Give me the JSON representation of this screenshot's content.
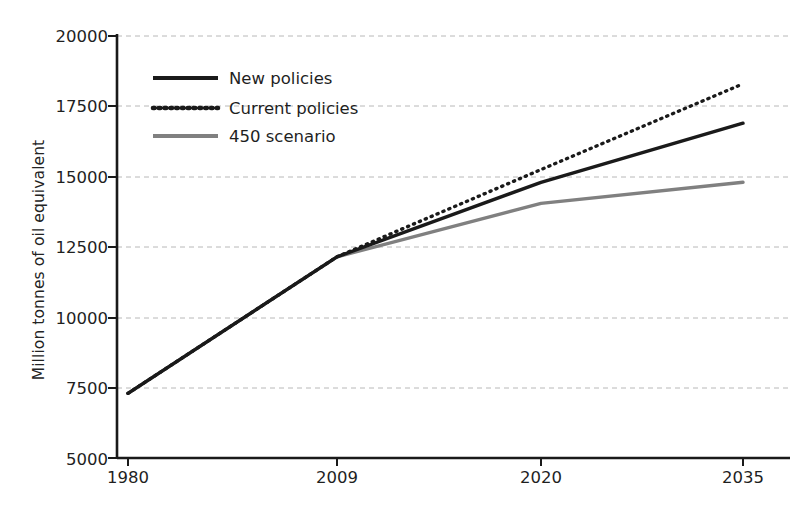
{
  "chart_data": {
    "type": "line",
    "title": "",
    "subtitle": "",
    "xlabel": "",
    "ylabel": "Million tonnes of oil equivalent",
    "categories": [
      "1980",
      "2009",
      "2020",
      "2035"
    ],
    "x_tick_labels": [
      "1980",
      "2009",
      "2020",
      "2035"
    ],
    "y_tick_labels": [
      "5000",
      "7500",
      "10000",
      "12500",
      "15000",
      "17500",
      "20000"
    ],
    "y_ticks": [
      5000,
      7500,
      10000,
      12500,
      15000,
      17500,
      20000
    ],
    "ylim": [
      5000,
      20000
    ],
    "grid": "horizontal-dashed",
    "legend_position": "upper-left-inside",
    "series": [
      {
        "name": "New policies",
        "style": "solid",
        "color": "#1a1a1a",
        "width": 3.4,
        "values": [
          7300,
          12150,
          14800,
          16900
        ]
      },
      {
        "name": "Current policies",
        "style": "dotted",
        "color": "#1a1a1a",
        "width": 3.4,
        "values": [
          7300,
          12150,
          15250,
          18300
        ]
      },
      {
        "name": "450 scenario",
        "style": "solid",
        "color": "#808080",
        "width": 3.4,
        "values": [
          7300,
          12150,
          14050,
          14800
        ]
      }
    ]
  },
  "legend": {
    "items": [
      {
        "label": "New policies",
        "swatch": "solid-black-line-swatch"
      },
      {
        "label": "Current policies",
        "swatch": "dotted-black-line-swatch"
      },
      {
        "label": "450 scenario",
        "swatch": "solid-gray-line-swatch"
      }
    ]
  },
  "colors": {
    "axis": "#1a1a1a",
    "grid": "#b8b8b8",
    "series_primary": "#1a1a1a",
    "series_secondary": "#808080",
    "background": "#ffffff",
    "text": "#1f1f1f"
  }
}
